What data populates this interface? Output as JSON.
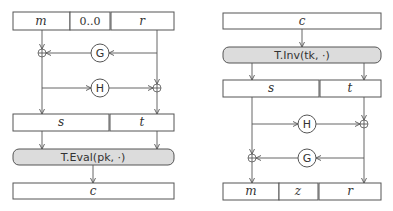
{
  "encrypt_diagram": {
    "input_fields": {
      "m": "m",
      "padding": "0..0",
      "r": "r"
    },
    "oracle_g": "G",
    "oracle_h": "H",
    "intermediate": {
      "s": "s",
      "t": "t"
    },
    "function": "T.Eval(pk, ·)",
    "output": "c"
  },
  "decrypt_diagram": {
    "input": "c",
    "function": "T.Inv(tk, ·)",
    "intermediate": {
      "s": "s",
      "t": "t"
    },
    "oracle_h": "H",
    "oracle_g": "G",
    "output_fields": {
      "m": "m",
      "z": "z",
      "r": "r"
    }
  }
}
